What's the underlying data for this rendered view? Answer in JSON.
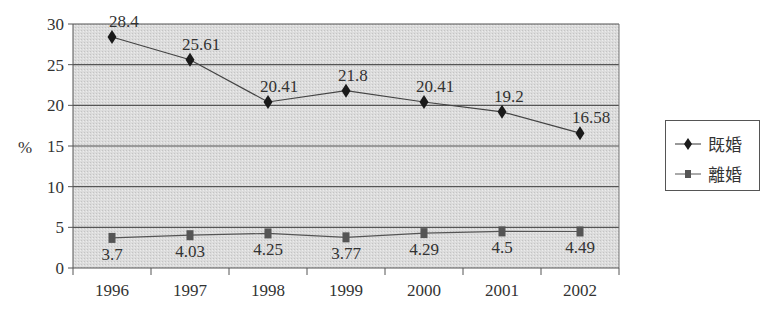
{
  "chart_data": {
    "type": "line",
    "title": "",
    "xlabel": "",
    "ylabel": "%",
    "ylim": [
      0,
      30
    ],
    "yticks": [
      0,
      5,
      10,
      15,
      20,
      25,
      30
    ],
    "grid": true,
    "legend_position": "right",
    "categories": [
      "1996",
      "1997",
      "1998",
      "1999",
      "2000",
      "2001",
      "2002"
    ],
    "series": [
      {
        "name": "既婚",
        "marker": "diamond",
        "color": "#1a1a1a",
        "values": [
          28.4,
          25.61,
          20.41,
          21.8,
          20.41,
          19.2,
          16.58
        ],
        "labels": [
          "28.4",
          "25.61",
          "20.41",
          "21.8",
          "20.41",
          "19.2",
          "16.58"
        ]
      },
      {
        "name": "離婚",
        "marker": "square",
        "color": "#555555",
        "values": [
          3.7,
          4.03,
          4.25,
          3.77,
          4.29,
          4.5,
          4.49
        ],
        "labels": [
          "3.7",
          "4.03",
          "4.25",
          "3.77",
          "4.29",
          "4.5",
          "4.49"
        ]
      }
    ]
  },
  "axis": {
    "y_label": "%",
    "y_ticks": [
      "0",
      "5",
      "10",
      "15",
      "20",
      "25",
      "30"
    ],
    "x_ticks": [
      "1996",
      "1997",
      "1998",
      "1999",
      "2000",
      "2001",
      "2002"
    ]
  },
  "legend": {
    "items": [
      {
        "label": "既婚",
        "icon": "diamond-marker-icon"
      },
      {
        "label": "離婚",
        "icon": "square-marker-icon"
      }
    ]
  },
  "colors": {
    "plot_bg": "#d9d9d9",
    "grid": "#555555",
    "married_line": "#1a1a1a",
    "divorced_line": "#555555"
  }
}
